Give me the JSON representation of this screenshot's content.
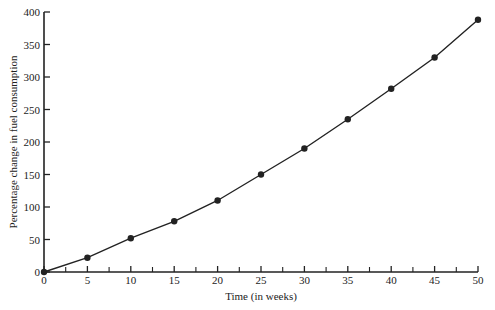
{
  "chart_data": {
    "type": "line",
    "title": "",
    "xlabel": "Time (in weeks)",
    "ylabel": "Percentage change in fuel consumption",
    "x": [
      0,
      5,
      10,
      15,
      20,
      25,
      30,
      35,
      40,
      45,
      50
    ],
    "series": [
      {
        "name": "Fuel consumption change",
        "values": [
          0,
          22,
          52,
          78,
          110,
          150,
          190,
          235,
          282,
          330,
          388
        ]
      }
    ],
    "xlim": [
      0,
      50
    ],
    "ylim": [
      0,
      400
    ],
    "xticks": [
      0,
      5,
      10,
      15,
      20,
      25,
      30,
      35,
      40,
      45,
      50
    ],
    "yticks": [
      0,
      50,
      100,
      150,
      200,
      250,
      300,
      350,
      400
    ],
    "grid": false,
    "marker": "circle",
    "line_color": "#222222"
  }
}
